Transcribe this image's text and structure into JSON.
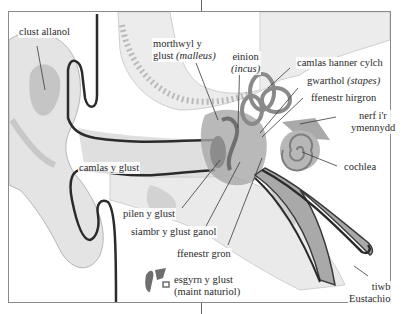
{
  "diagram": {
    "colors": {
      "background": "#ffffff",
      "frame": "#8a8a8a",
      "tissue_light": "#e6e6e6",
      "tissue_mid": "#bdbdbd",
      "tissue_dark": "#8c8c8c",
      "canal_line": "#2b2b2b",
      "label_text": "#2a2a2a",
      "leader_line": "#3a3a3a"
    },
    "labels": {
      "outer_ear": "clust allanol",
      "malleus_line1": "morthwyl y",
      "malleus_line2": "glust ",
      "malleus_latin": "(malleus)",
      "incus": "einion",
      "incus_latin": "(incus)",
      "semicircular_canal": "camlas hanner cylch",
      "stapes": "gwarthol ",
      "stapes_latin": "(stapes)",
      "oval_window": "ffenestr hirgron",
      "auditory_nerve_line1": "nerf i'r",
      "auditory_nerve_line2": "ymennydd",
      "cochlea": "cochlea",
      "ear_canal": "camlas y glust",
      "eardrum": "pilen y glust",
      "middle_ear_chamber": "siambr y glust ganol",
      "round_window": "ffenestr gron",
      "ossicles_line1": "esgyrn y glust",
      "ossicles_line2": "(maint naturiol)",
      "eustachian_line1": "tiwb",
      "eustachian_line2": "Eustachio"
    }
  }
}
